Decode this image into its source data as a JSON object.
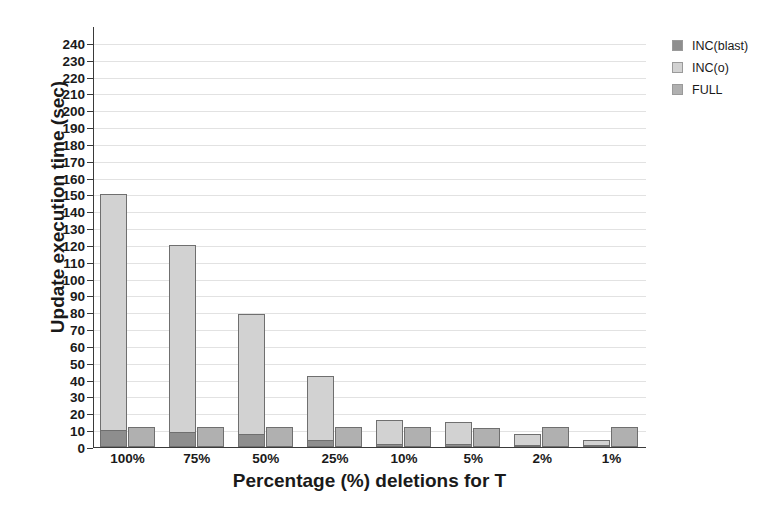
{
  "chart_data": {
    "type": "bar",
    "title": "",
    "xlabel": "Percentage (%) deletions for T",
    "ylabel": "Update execution time (sec)",
    "categories": [
      "100%",
      "75%",
      "50%",
      "25%",
      "10%",
      "5%",
      "2%",
      "1%"
    ],
    "series": [
      {
        "name": "INC(blast)",
        "color": "#8e8e8e",
        "values": [
          10,
          9,
          8,
          4,
          2,
          2,
          1,
          1
        ]
      },
      {
        "name": "INC(o)",
        "color": "#d2d2d2",
        "values": [
          150,
          120,
          79,
          42,
          16,
          15,
          8,
          4
        ]
      },
      {
        "name": "FULL",
        "color": "#b0b0b0",
        "values": [
          12,
          12,
          12,
          12,
          12,
          11,
          12,
          12
        ]
      }
    ],
    "ylim": [
      0,
      250
    ],
    "ytick_step": 10,
    "ytick_labels": [
      "0",
      "10",
      "20",
      "30",
      "40",
      "50",
      "60",
      "70",
      "80",
      "90",
      "100",
      "110",
      "120",
      "130",
      "140",
      "150",
      "160",
      "170",
      "180",
      "190",
      "200",
      "210",
      "220",
      "230",
      "240"
    ],
    "grid": true,
    "grid_axis": "y",
    "legend_position": "top-right",
    "legend": [
      "INC(blast)",
      "INC(o)",
      "FULL"
    ]
  }
}
